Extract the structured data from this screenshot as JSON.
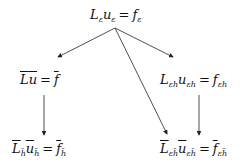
{
  "diagram": {
    "nodes": [
      {
        "id": "top",
        "lhs_op": "L",
        "lhs_op_sub": "ε",
        "lhs_var": "u",
        "lhs_var_sub": "ε",
        "eq": "=",
        "rhs": "f",
        "rhs_sub": "ε",
        "bar": false
      },
      {
        "id": "mid_left",
        "lhs_op": "L",
        "lhs_op_sub": "",
        "lhs_var": "u",
        "lhs_var_sub": "",
        "eq": "=",
        "rhs": "f",
        "rhs_sub": "",
        "bar": true
      },
      {
        "id": "mid_right",
        "lhs_op": "L",
        "lhs_op_sub": "εh",
        "lhs_var": "u",
        "lhs_var_sub": "εh",
        "eq": "=",
        "rhs": "f",
        "rhs_sub": "εh",
        "bar": false
      },
      {
        "id": "bot_left",
        "lhs_op": "L",
        "lhs_op_sub": "h̄",
        "lhs_var": "u",
        "lhs_var_sub": "h̄",
        "eq": "=",
        "rhs": "f",
        "rhs_sub": "h̄",
        "bar": true
      },
      {
        "id": "bot_right",
        "lhs_op": "L",
        "lhs_op_sub": "εh̄",
        "lhs_var": "u",
        "lhs_var_sub": "εh̄",
        "eq": "=",
        "rhs": "f",
        "rhs_sub": "εh̄",
        "bar": true
      }
    ],
    "edges": [
      {
        "from": "top",
        "to": "mid_left"
      },
      {
        "from": "top",
        "to": "mid_right"
      },
      {
        "from": "top",
        "to": "bot_right"
      },
      {
        "from": "mid_left",
        "to": "bot_left"
      },
      {
        "from": "mid_right",
        "to": "bot_right"
      }
    ]
  }
}
